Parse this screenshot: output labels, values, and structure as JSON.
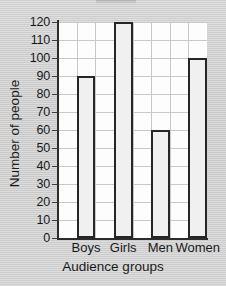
{
  "chart_data": {
    "type": "bar",
    "title": "",
    "categories": [
      "Boys",
      "Girls",
      "Men",
      "Women"
    ],
    "values": [
      90,
      120,
      60,
      100
    ],
    "xlabel": "Audience groups",
    "ylabel": "Number of people",
    "ylim": [
      0,
      120
    ],
    "ytick_step": 10,
    "yticks": [
      0,
      10,
      20,
      30,
      40,
      50,
      60,
      70,
      80,
      90,
      100,
      110,
      120
    ],
    "ytick_labels": [
      "0",
      "10",
      "20",
      "30",
      "40",
      "50",
      "60",
      "70",
      "80",
      "90",
      "100",
      "110",
      "120"
    ],
    "grid": true,
    "grid_axes": "both",
    "legend": null,
    "legend_position": "none",
    "bar_fill_color": "#f0f0f0",
    "bar_edge_color": "#262626",
    "plot_background_color": "#fdfdfd",
    "page_background_color": "#cfcfcf",
    "gridline_color": "#c9c9c9",
    "axis_color": "#2b2b2b",
    "series": [
      {
        "name": "Number of people",
        "values": [
          90,
          120,
          60,
          100
        ]
      }
    ],
    "annotations": []
  }
}
